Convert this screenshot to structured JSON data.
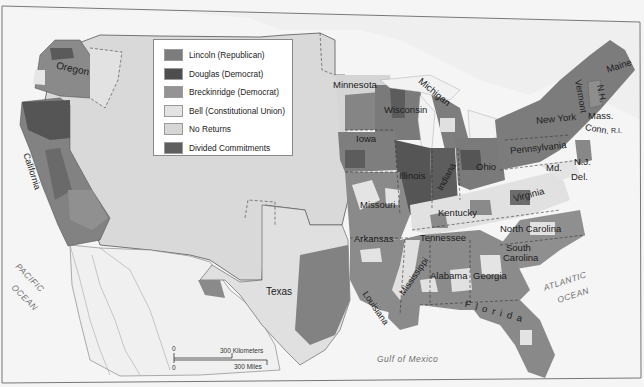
{
  "colors": {
    "lincoln": "#7c7c7c",
    "douglas": "#4e4e4e",
    "breckinridge": "#949494",
    "bell": "#e3e3e3",
    "no_returns": "#d6d6d6",
    "divided": "#5f5f5f",
    "land": "#d2d2d2",
    "water": "#f4f4f4"
  },
  "legend": {
    "items": [
      {
        "label": "Lincoln (Republican)",
        "color": "#7c7c7c"
      },
      {
        "label": "Douglas (Democrat)",
        "color": "#4e4e4e"
      },
      {
        "label": "Breckinridge (Democrat)",
        "color": "#949494"
      },
      {
        "label": "Bell (Constitutional Union)",
        "color": "#e3e3e3"
      },
      {
        "label": "No Returns",
        "color": "#d6d6d6"
      },
      {
        "label": "Divided Commitments",
        "color": "#5f5f5f"
      }
    ]
  },
  "state_labels": {
    "oregon": "Oregon",
    "california": "California",
    "minnesota": "Minnesota",
    "wisconsin": "Wisconsin",
    "michigan": "Michigan",
    "iowa": "Iowa",
    "illinois": "Illinois",
    "indiana": "Indiana",
    "ohio": "Ohio",
    "missouri": "Missouri",
    "kentucky": "Kentucky",
    "arkansas": "Arkansas",
    "tennessee": "Tennessee",
    "mississippi": "Mississippi",
    "alabama": "Alabama",
    "georgia": "Georgia",
    "louisiana": "Louisiana",
    "florida": "Florida",
    "texas": "Texas",
    "virginia": "Virginia",
    "north_carolina": "North Carolina",
    "south_carolina_1": "South",
    "south_carolina_2": "Carolina",
    "pennsylvania": "Pennsylvania",
    "new_york": "New York",
    "maryland": "Md.",
    "delaware": "Del.",
    "new_jersey": "N.J.",
    "vermont": "Vermont",
    "new_hampshire": "N.H.",
    "massachusetts": "Mass.",
    "connecticut": "Conn.",
    "rhode_island": "R.I.",
    "maine": "Maine"
  },
  "water_labels": {
    "pacific_1": "PACIFIC",
    "pacific_2": "OCEAN",
    "atlantic_1": "ATLANTIC",
    "atlantic_2": "OCEAN",
    "gulf": "Gulf of Mexico"
  },
  "scale_bar": {
    "zero_top": "0",
    "km": "300 Kilometers",
    "zero_bottom": "0",
    "miles": "300 Miles"
  }
}
